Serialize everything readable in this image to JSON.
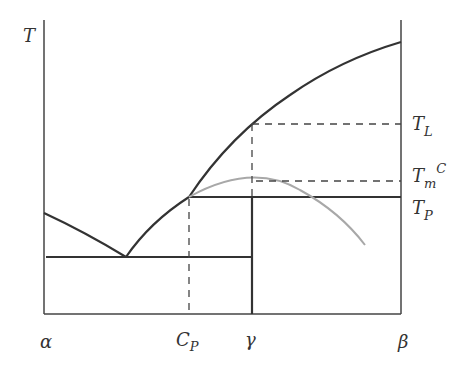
{
  "diagram": {
    "type": "phase-diagram",
    "axis_label_y": "T",
    "x_labels": {
      "alpha": "α",
      "cp_main": "C",
      "cp_sub": "P",
      "gamma": "γ",
      "beta": "β"
    },
    "right_labels": {
      "tl_main": "T",
      "tl_sub": "L",
      "tmc_main": "T",
      "tmc_sub": "m",
      "tmc_sup": "C",
      "tp_main": "T",
      "tp_sub": "P"
    },
    "colors": {
      "line": "#333333",
      "metastable_curve": "#a8a8a8",
      "dashed": "#444444"
    }
  }
}
